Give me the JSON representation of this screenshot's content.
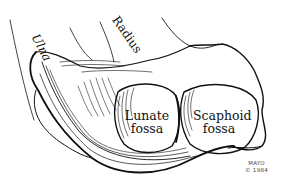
{
  "figure": {
    "labels": {
      "ulna": "Ulna",
      "radius": "Radius",
      "lunate_line1": "Lunate",
      "lunate_line2": "fossa",
      "scaphoid_line1": "Scaphoid",
      "scaphoid_line2": "fossa"
    },
    "credit": {
      "line1": "MAYO",
      "line2": "© 1984"
    },
    "colors": {
      "ink": "#111111",
      "paper": "#ffffff"
    }
  }
}
